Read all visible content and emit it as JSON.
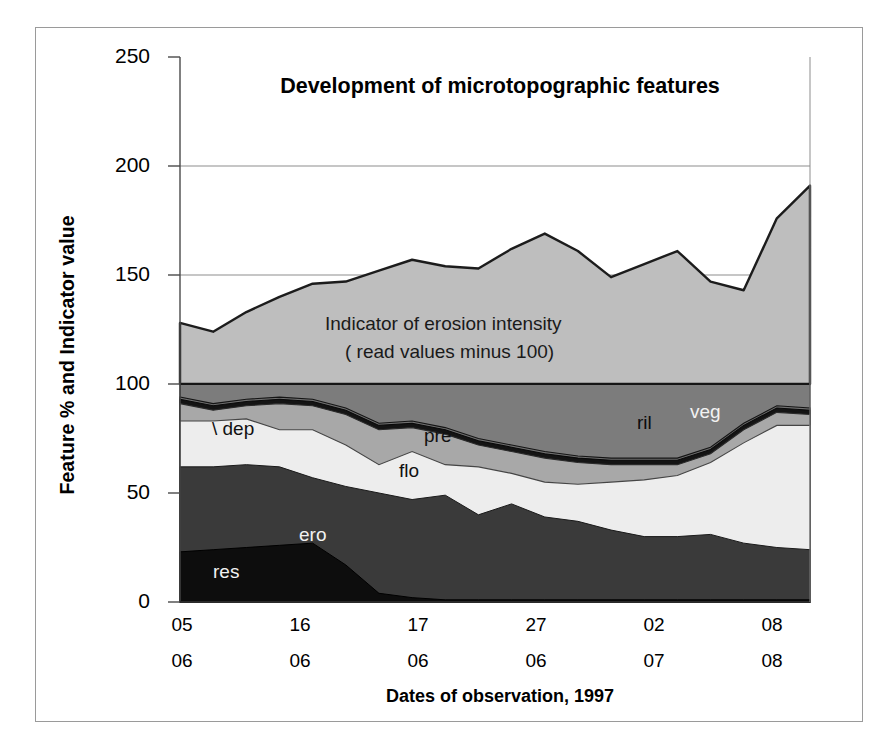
{
  "figure": {
    "outer_border_color": "#9a9a9a",
    "background": "#ffffff"
  },
  "chart_data": {
    "type": "area",
    "stacked": true,
    "title": "Development of microtopographic features",
    "xlabel": "Dates of observation, 1997",
    "ylabel": "Feature % and Indicator value",
    "ylim": [
      0,
      250
    ],
    "yticks": [
      0,
      50,
      100,
      150,
      200,
      250
    ],
    "ytick_labels": [
      "0",
      "50",
      "100",
      "150",
      "200",
      "250"
    ],
    "grid": "horizontal",
    "legend": "inline-labels",
    "x": [
      1,
      2,
      3,
      4,
      5,
      6,
      7,
      8,
      9,
      10,
      11,
      12,
      13,
      14,
      15,
      16,
      17,
      18,
      19,
      20
    ],
    "xtick_positions": [
      1,
      4,
      7,
      10,
      13,
      16
    ],
    "xtick_labels_day": [
      "05",
      "16",
      "17",
      "27",
      "02",
      "08"
    ],
    "xtick_labels_month": [
      "06",
      "06",
      "06",
      "06",
      "07",
      "08"
    ],
    "annotations": [
      {
        "name": "indicator-note-line1",
        "text": "Indicator of erosion intensity"
      },
      {
        "name": "indicator-note-line2",
        "text": "( read values minus 100)"
      }
    ],
    "series": [
      {
        "name": "res",
        "label": "res",
        "color": "#0d0d0d",
        "values": [
          23,
          24,
          25,
          26,
          27,
          17,
          4,
          2,
          1,
          1,
          1,
          1,
          1,
          1,
          1,
          1,
          1,
          1,
          1,
          1
        ]
      },
      {
        "name": "ero",
        "label": "ero",
        "color": "#393939",
        "values": [
          39,
          38,
          38,
          36,
          30,
          36,
          46,
          45,
          48,
          39,
          44,
          38,
          36,
          32,
          29,
          29,
          30,
          26,
          24,
          23
        ]
      },
      {
        "name": "flo",
        "label": "flo",
        "color": "#ececec",
        "values": [
          21,
          21,
          21,
          17,
          22,
          19,
          13,
          22,
          14,
          22,
          14,
          16,
          17,
          22,
          26,
          28,
          33,
          46,
          56,
          57
        ]
      },
      {
        "name": "pre",
        "label": "pre",
        "color": "#a6a6a6",
        "values": [
          8,
          5,
          6,
          12,
          11,
          14,
          16,
          11,
          14,
          10,
          10,
          11,
          10,
          8,
          7,
          5,
          4,
          6,
          6,
          5
        ]
      },
      {
        "name": "dep",
        "label": "dep",
        "color": "#141414",
        "values": [
          2,
          2,
          2,
          2,
          2,
          2,
          2,
          2,
          2,
          2,
          2,
          2,
          2,
          2,
          2,
          2,
          2,
          2,
          2,
          2
        ]
      },
      {
        "name": "ril",
        "label": "ril",
        "color": "#6e6e6e",
        "values": [
          1,
          1,
          1,
          1,
          1,
          1,
          1,
          1,
          1,
          1,
          1,
          1,
          1,
          1,
          1,
          1,
          1,
          1,
          1,
          1
        ]
      },
      {
        "name": "veg",
        "label": "veg",
        "color": "#7b7b7b",
        "values": [
          6,
          9,
          7,
          6,
          7,
          11,
          18,
          17,
          20,
          25,
          28,
          31,
          33,
          34,
          34,
          34,
          29,
          18,
          10,
          11
        ]
      },
      {
        "name": "indicator",
        "label": "Indicator of erosion intensity",
        "color": "#bdbdbd",
        "note": "read values minus 100",
        "values": [
          128,
          124,
          133,
          140,
          146,
          147,
          152,
          157,
          154,
          153,
          162,
          169,
          161,
          149,
          155,
          161,
          147,
          143,
          176,
          191
        ]
      }
    ]
  },
  "labels": {
    "title": "Development of microtopographic features",
    "xaxis_title": "Dates of observation, 1997",
    "yaxis_title": "Feature % and Indicator value",
    "indicator_note_1": "Indicator of erosion intensity",
    "indicator_note_2": "( read values minus 100)",
    "dep": "\\ dep",
    "pre": "pre",
    "flo": "flo",
    "ril": "ril",
    "veg": "veg",
    "ero": "ero",
    "res": "res"
  },
  "ytick_labels": [
    "250",
    "200",
    "150",
    "100",
    "50",
    "0"
  ],
  "xtick_days": [
    "05",
    "16",
    "17",
    "27",
    "02",
    "08"
  ],
  "xtick_months": [
    "06",
    "06",
    "06",
    "06",
    "07",
    "08"
  ]
}
